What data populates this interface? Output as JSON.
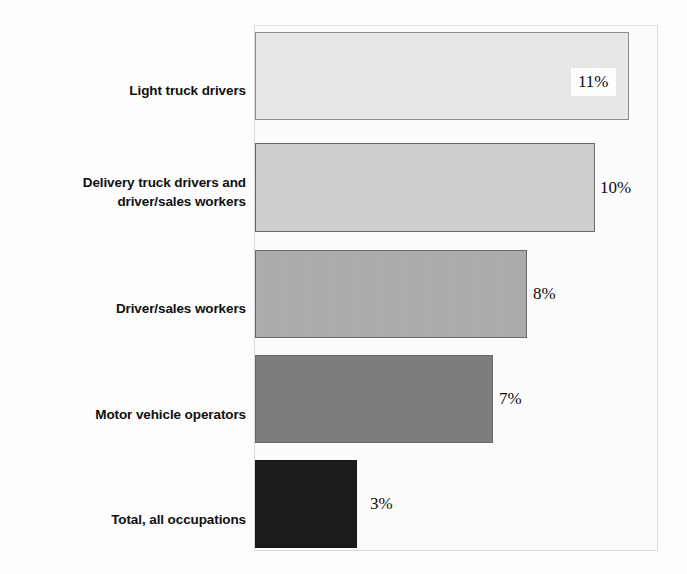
{
  "chart_data": {
    "type": "bar",
    "orientation": "horizontal",
    "title": "",
    "xlabel": "",
    "ylabel": "",
    "xlim": [
      0,
      12
    ],
    "grid": false,
    "legend": null,
    "categories": [
      "Light truck drivers",
      "Delivery truck drivers and driver/sales workers",
      "Driver/sales workers",
      "Motor vehicle operators",
      "Total, all occupations"
    ],
    "values": [
      11,
      10,
      8,
      7,
      3
    ],
    "value_labels": [
      "11%",
      "10%",
      "8%",
      "7%",
      "3%"
    ],
    "bar_colors": [
      "#e8e8e8",
      "#cfcfcf",
      "#adadad",
      "#7d7d7d",
      "#1c1c1c"
    ],
    "units": "percent"
  },
  "chart": {
    "title": "",
    "categories": [
      {
        "lines": [
          "Light truck drivers"
        ]
      },
      {
        "lines": [
          "Delivery truck drivers and",
          "driver/sales workers"
        ]
      },
      {
        "lines": [
          "Driver/sales workers"
        ]
      },
      {
        "lines": [
          "Motor vehicle operators"
        ]
      },
      {
        "lines": [
          "Total, all occupations"
        ]
      }
    ],
    "bars": [
      {
        "label": "11%",
        "value": 11,
        "color": "#e8e8e8",
        "label_position": "inside"
      },
      {
        "label": "10%",
        "value": 10,
        "color": "#cfcfcf",
        "label_position": "outside"
      },
      {
        "label": "8%",
        "value": 8,
        "color": "#adadad",
        "label_position": "outside"
      },
      {
        "label": "7%",
        "value": 7,
        "color": "#7d7d7d",
        "label_position": "outside"
      },
      {
        "label": "3%",
        "value": 3,
        "color": "#1c1c1c",
        "label_position": "outside"
      }
    ]
  }
}
